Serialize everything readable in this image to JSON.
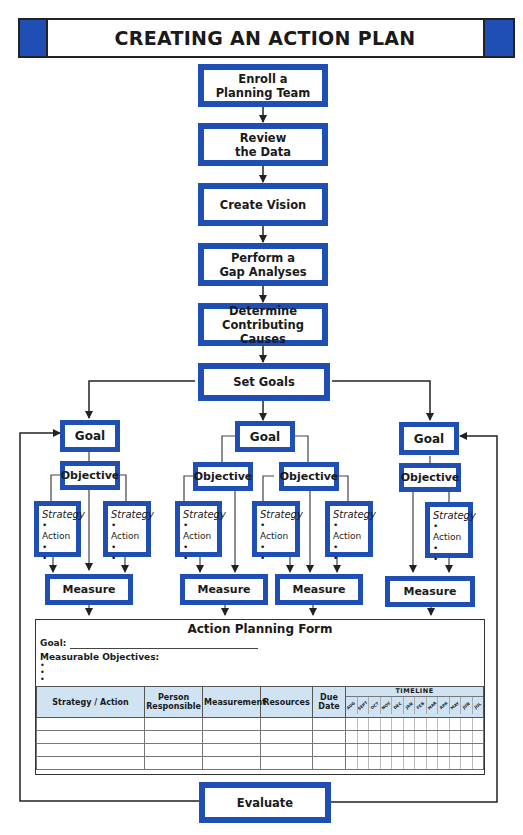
{
  "title": "CREATING AN ACTION PLAN",
  "colors": {
    "accent_blue": "#1f4fb5",
    "header_fill": "#cfe3f3",
    "line": "#222222"
  },
  "process_steps": [
    {
      "label": "Enroll a\nPlanning Team",
      "line1": "Enroll a",
      "line2": "Planning Team"
    },
    {
      "label": "Review\nthe Data",
      "line1": "Review",
      "line2": "the Data"
    },
    {
      "label": "Create Vision",
      "line1": "Create Vision",
      "line2": ""
    },
    {
      "label": "Perform a\nGap Analyses",
      "line1": "Perform a",
      "line2": "Gap Analyses"
    },
    {
      "label": "Determine\nContributing Causes",
      "line1": "Determine",
      "line2": "Contributing Causes"
    },
    {
      "label": "Set Goals",
      "line1": "Set Goals",
      "line2": ""
    }
  ],
  "branches": {
    "goal_label": "Goal",
    "objective_label": "Objective",
    "measure_label": "Measure",
    "strategy": {
      "title": "Strategy",
      "item": "• Action",
      "bullet": "•"
    }
  },
  "form": {
    "title": "Action Planning Form",
    "goal_label": "Goal:",
    "measurable_objectives_label": "Measurable Objectives:",
    "bullets": [
      "•",
      "•",
      "•"
    ],
    "columns": [
      "Strategy / Action",
      "Person Responsible",
      "Measurement",
      "Resources",
      "Due Date",
      "TIMELINE"
    ],
    "timeline_months": [
      "AUG",
      "SEPT",
      "OCT",
      "NOV",
      "DEC",
      "JAN",
      "FEB",
      "MAR",
      "APR",
      "MAY",
      "JUN",
      "JUL"
    ],
    "row_count": 4
  },
  "evaluate_label": "Evaluate"
}
